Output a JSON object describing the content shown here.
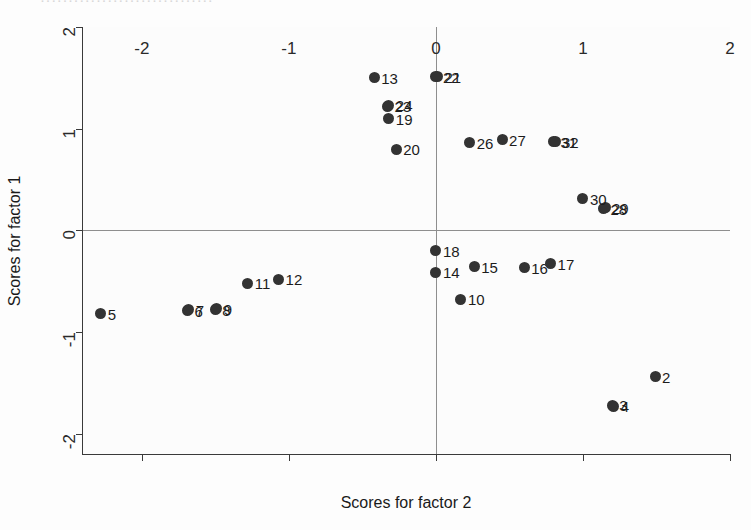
{
  "figure": {
    "scan_fragment": "·······························",
    "marker_color": "#333333",
    "axis_color": "#3a3a3a",
    "reference_line_color": "#8e8e8e",
    "background": "#fcfcfc"
  },
  "chart_data": {
    "type": "scatter",
    "title": "",
    "xlabel": "Scores for factor 2",
    "ylabel": "Scores for factor 1",
    "xlim": [
      -2.4,
      2.0
    ],
    "ylim": [
      -2.2,
      2.0
    ],
    "xticks": [
      -2,
      -1,
      0,
      1,
      2
    ],
    "xticklabels": [
      "-2",
      "-1",
      "0",
      "1",
      "2"
    ],
    "yticks": [
      -2,
      -1,
      0,
      1,
      2
    ],
    "yticklabels": [
      "-2",
      "-1",
      "0",
      "1",
      "2"
    ],
    "grid": false,
    "legend": "none",
    "reference_lines": {
      "x": 0,
      "y": 0
    },
    "points": [
      {
        "label": "2",
        "x": 1.49,
        "y": -1.44
      },
      {
        "label": "3",
        "x": 1.2,
        "y": -1.72
      },
      {
        "label": "4",
        "x": 1.21,
        "y": -1.73
      },
      {
        "label": "5",
        "x": -2.28,
        "y": -0.82
      },
      {
        "label": "6",
        "x": -1.69,
        "y": -0.79
      },
      {
        "label": "7",
        "x": -1.68,
        "y": -0.78
      },
      {
        "label": "8",
        "x": -1.5,
        "y": -0.78
      },
      {
        "label": "9",
        "x": -1.49,
        "y": -0.77
      },
      {
        "label": "10",
        "x": 0.17,
        "y": -0.68
      },
      {
        "label": "11",
        "x": -1.28,
        "y": -0.52
      },
      {
        "label": "12",
        "x": -1.07,
        "y": -0.48
      },
      {
        "label": "13",
        "x": -0.42,
        "y": 1.5
      },
      {
        "label": "14",
        "x": 0.0,
        "y": -0.41
      },
      {
        "label": "15",
        "x": 0.26,
        "y": -0.36
      },
      {
        "label": "16",
        "x": 0.6,
        "y": -0.37
      },
      {
        "label": "17",
        "x": 0.78,
        "y": -0.33
      },
      {
        "label": "18",
        "x": 0.0,
        "y": -0.2
      },
      {
        "label": "19",
        "x": -0.32,
        "y": 1.1
      },
      {
        "label": "20",
        "x": -0.27,
        "y": 0.8
      },
      {
        "label": "21",
        "x": 0.01,
        "y": 1.51
      },
      {
        "label": "22",
        "x": 0.0,
        "y": 1.51
      },
      {
        "label": "23",
        "x": -0.33,
        "y": 1.22
      },
      {
        "label": "24",
        "x": -0.32,
        "y": 1.23
      },
      {
        "label": "26",
        "x": 0.23,
        "y": 0.86
      },
      {
        "label": "27",
        "x": 0.45,
        "y": 0.89
      },
      {
        "label": "28",
        "x": 1.14,
        "y": 0.21
      },
      {
        "label": "29",
        "x": 1.15,
        "y": 0.22
      },
      {
        "label": "30",
        "x": 1.0,
        "y": 0.31
      },
      {
        "label": "31",
        "x": 0.8,
        "y": 0.87
      },
      {
        "label": "32",
        "x": 0.81,
        "y": 0.87
      }
    ]
  }
}
